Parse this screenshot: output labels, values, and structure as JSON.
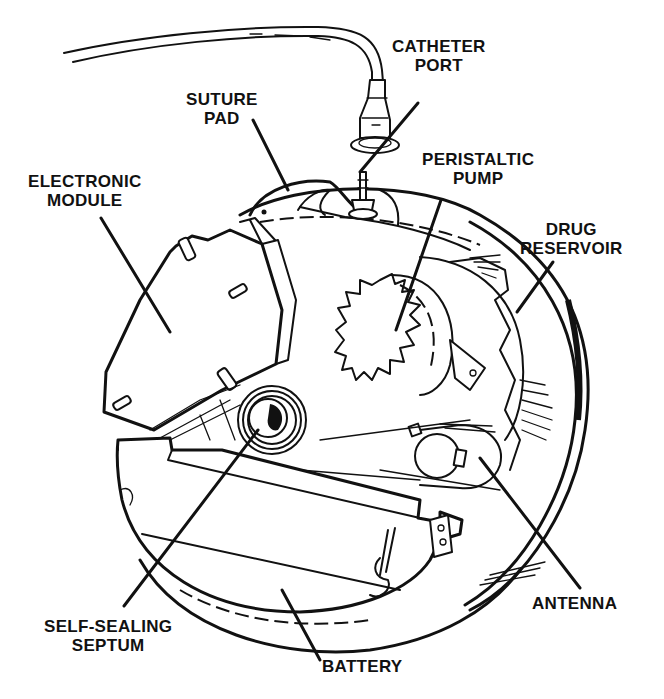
{
  "diagram": {
    "colors": {
      "ink": "#111111",
      "background": "#ffffff"
    },
    "labels": {
      "catheter_port": [
        "CATHETER",
        "PORT"
      ],
      "suture_pad": [
        "SUTURE",
        "PAD"
      ],
      "peristaltic_pump": [
        "PERISTALTIC",
        "PUMP"
      ],
      "electronic_module": [
        "ELECTRONIC",
        "MODULE"
      ],
      "drug_reservoir": [
        "DRUG",
        "RESERVOIR"
      ],
      "self_sealing_septum": [
        "SELF-SEALING",
        "SEPTUM"
      ],
      "battery": [
        "BATTERY"
      ],
      "antenna": [
        "ANTENNA"
      ]
    }
  }
}
